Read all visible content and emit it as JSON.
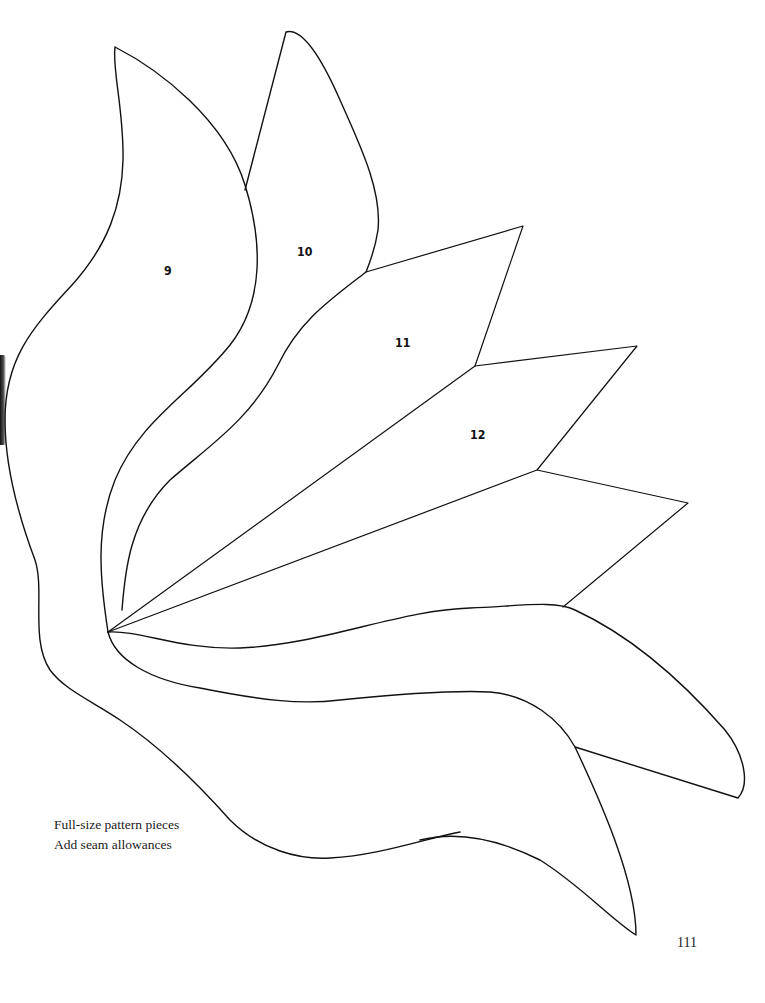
{
  "page": {
    "type": "pattern-sheet",
    "page_number": "111"
  },
  "pieces": [
    {
      "id": "piece-9",
      "label": "9"
    },
    {
      "id": "piece-10",
      "label": "10"
    },
    {
      "id": "piece-11",
      "label": "11"
    },
    {
      "id": "piece-12",
      "label": "12"
    }
  ],
  "caption": {
    "line1": "Full-size pattern pieces",
    "line2": "Add seam allowances"
  },
  "colors": {
    "line": "#111111",
    "paper": "#ffffff"
  }
}
